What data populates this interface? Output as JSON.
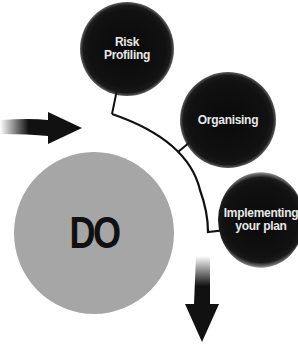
{
  "diagram": {
    "center": {
      "label": "DO",
      "color": "#a6a6a6"
    },
    "steps": [
      {
        "label": "Risk\nProfiling"
      },
      {
        "label": "Organising"
      },
      {
        "label": "Implementing\nyour plan"
      }
    ],
    "arrows": [
      {
        "name": "incoming-arrow",
        "direction": "right"
      },
      {
        "name": "outgoing-arrow",
        "direction": "down"
      }
    ],
    "colors": {
      "node": "#111111",
      "node_text": "#e8e8e8",
      "line": "#111111"
    }
  }
}
